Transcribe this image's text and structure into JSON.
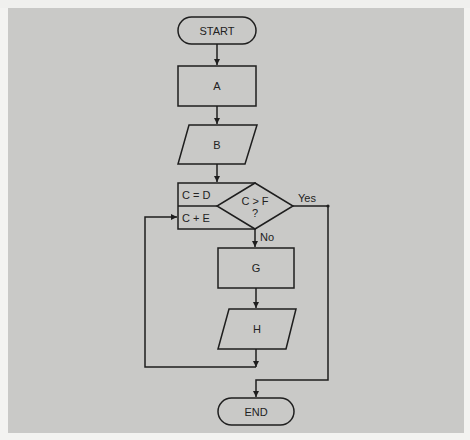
{
  "diagram": {
    "type": "flowchart",
    "colors": {
      "background": "#c9c9c7",
      "line": "#1e1e1e",
      "page": "#f3f3f1"
    },
    "nodes": [
      {
        "id": "start",
        "shape": "terminator",
        "label": "START"
      },
      {
        "id": "a",
        "shape": "process",
        "label": "A"
      },
      {
        "id": "b",
        "shape": "input-output",
        "label": "B"
      },
      {
        "id": "init",
        "shape": "process",
        "label": "C = D"
      },
      {
        "id": "incr",
        "shape": "process",
        "label": "C + E"
      },
      {
        "id": "decision",
        "shape": "decision",
        "label_line1": "C > F",
        "label_line2": "?"
      },
      {
        "id": "g",
        "shape": "process",
        "label": "G"
      },
      {
        "id": "h",
        "shape": "input-output",
        "label": "H"
      },
      {
        "id": "end",
        "shape": "terminator",
        "label": "END"
      }
    ],
    "edges": [
      {
        "from": "start",
        "to": "a"
      },
      {
        "from": "a",
        "to": "b"
      },
      {
        "from": "b",
        "to": "init"
      },
      {
        "from": "decision",
        "to": "end",
        "label": "Yes"
      },
      {
        "from": "decision",
        "to": "g",
        "label": "No"
      },
      {
        "from": "g",
        "to": "h"
      },
      {
        "from": "h",
        "to": "incr",
        "label": ""
      }
    ],
    "edge_labels": {
      "yes": "Yes",
      "no": "No"
    }
  }
}
